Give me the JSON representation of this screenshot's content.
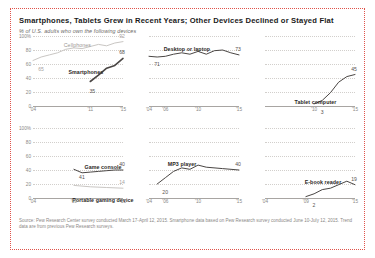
{
  "header": {
    "title": "Smartphones, Tablets Grew in Recent Years; Other Devices Declined or Stayed Flat",
    "subtitle": "% of U.S. adults who own the following devices"
  },
  "footnote": "Source: Pew Research Center survey conducted March 17-April 12, 2015. Smartphone data based on Pew Research survey conducted June 10-July 12, 2015. Trend data are from previous Pew Research surveys.",
  "axis": {
    "yticks_full": [
      "100%",
      "80",
      "60",
      "40",
      "20",
      "0"
    ],
    "yticks_values": [
      100,
      80,
      60,
      40,
      20,
      0
    ],
    "ylim": [
      0,
      100
    ]
  },
  "chart_data": [
    {
      "type": "line",
      "title": "Cellphones / Smartphones",
      "xlabel": "",
      "ylabel": "% of U.S. adults",
      "ylim": [
        0,
        100
      ],
      "xticks": [
        "'04",
        "'11",
        "'15"
      ],
      "xtick_positions": [
        2004,
        2011,
        2015
      ],
      "grid": true,
      "legend_position": "inline",
      "series": [
        {
          "name": "Cellphones",
          "label_start": "65",
          "label_end": "92",
          "x": [
            2004,
            2005,
            2006,
            2007,
            2008,
            2009,
            2010,
            2011,
            2012,
            2013,
            2014,
            2015
          ],
          "values": [
            65,
            70,
            73,
            76,
            81,
            83,
            82,
            85,
            88,
            86,
            90,
            92
          ]
        },
        {
          "name": "Smartphones",
          "label_start": "35",
          "label_end": "68",
          "x": [
            2011,
            2012,
            2013,
            2014,
            2015
          ],
          "values": [
            35,
            44,
            54,
            58,
            68
          ]
        }
      ]
    },
    {
      "type": "line",
      "title": "Desktop or laptop",
      "ylim": [
        0,
        100
      ],
      "xticks": [
        "'04",
        "'06",
        "'10",
        "'15"
      ],
      "xtick_positions": [
        2004,
        2006,
        2010,
        2015
      ],
      "grid": true,
      "series": [
        {
          "name": "Desktop or laptop",
          "label_start": "71",
          "label_end": "73",
          "x": [
            2004,
            2005,
            2006,
            2007,
            2008,
            2009,
            2010,
            2011,
            2012,
            2013,
            2014,
            2015
          ],
          "values": [
            71,
            70,
            71,
            74,
            76,
            74,
            78,
            74,
            79,
            80,
            76,
            73
          ]
        }
      ]
    },
    {
      "type": "line",
      "title": "Tablet computer",
      "ylim": [
        0,
        100
      ],
      "xticks": [
        "'10",
        "'15"
      ],
      "xtick_positions": [
        2010,
        2015
      ],
      "grid": true,
      "series": [
        {
          "name": "Tablet computer",
          "label_start": "3",
          "label_end": "45",
          "x": [
            2010,
            2011,
            2012,
            2013,
            2014,
            2015
          ],
          "values": [
            3,
            8,
            19,
            34,
            42,
            45
          ]
        }
      ]
    },
    {
      "type": "line",
      "title": "Game console / Portable gaming device",
      "ylim": [
        0,
        100
      ],
      "xticks": [
        "'04",
        "'09",
        "'15"
      ],
      "xtick_positions": [
        2004,
        2009,
        2015
      ],
      "grid": true,
      "series": [
        {
          "name": "Game console",
          "label_start": "41",
          "label_end": "40",
          "x": [
            2009,
            2010,
            2011,
            2012,
            2013,
            2014,
            2015
          ],
          "values": [
            41,
            36,
            37,
            38,
            39,
            40,
            40
          ]
        },
        {
          "name": "Portable gaming device",
          "label_start": "",
          "label_end": "14",
          "x": [
            2009,
            2011,
            2013,
            2015
          ],
          "values": [
            18,
            16,
            15,
            14
          ]
        }
      ]
    },
    {
      "type": "line",
      "title": "MP3 player",
      "ylim": [
        0,
        100
      ],
      "xticks": [
        "'04",
        "'06",
        "'10",
        "'15"
      ],
      "xtick_positions": [
        2004,
        2006,
        2010,
        2015
      ],
      "grid": true,
      "series": [
        {
          "name": "MP3 player",
          "label_start": "20",
          "label_end": "40",
          "x": [
            2005,
            2006,
            2007,
            2008,
            2009,
            2010,
            2011,
            2013,
            2015
          ],
          "values": [
            20,
            29,
            38,
            43,
            41,
            47,
            44,
            42,
            40
          ]
        }
      ]
    },
    {
      "type": "line",
      "title": "E-book reader",
      "ylim": [
        0,
        100
      ],
      "xticks": [
        "'04",
        "'09",
        "'15"
      ],
      "xtick_positions": [
        2004,
        2009,
        2015
      ],
      "grid": true,
      "series": [
        {
          "name": "E-book reader",
          "label_start": "2",
          "label_end": "19",
          "x": [
            2009,
            2010,
            2011,
            2012,
            2013,
            2014,
            2015
          ],
          "values": [
            2,
            6,
            12,
            14,
            19,
            24,
            19
          ]
        }
      ]
    }
  ]
}
